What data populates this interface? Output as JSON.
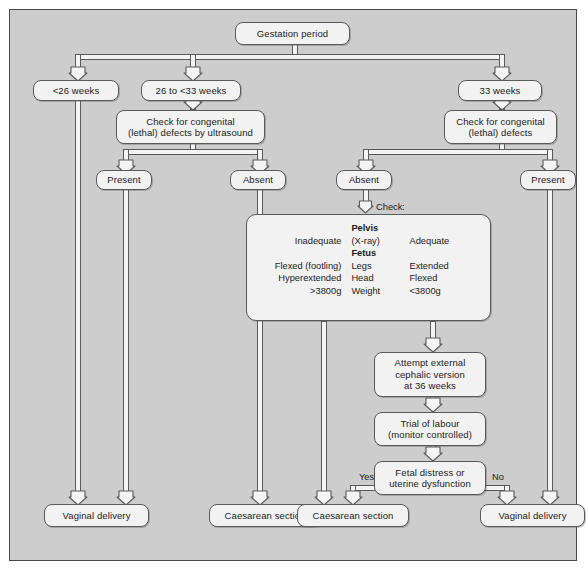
{
  "diagram": {
    "background_color": "#cdcdcd",
    "node_fill": "#f2f2f2",
    "border_color": "#5a5a5a"
  },
  "nodes": {
    "gestation_period": "Gestation period",
    "weeks_lt26": "<26 weeks",
    "weeks_26_to_33": "26 to <33 weeks",
    "weeks_33": "33 weeks",
    "check_ultrasound_l1": "Check for congenital",
    "check_ultrasound_l2": "(lethal) defects by ultrasound",
    "check_defects_l1": "Check for congenital",
    "check_defects_l2": "(lethal) defects",
    "mid_present": "Present",
    "mid_absent": "Absent",
    "right_absent": "Absent",
    "right_present": "Present",
    "ecv_l1": "Attempt external",
    "ecv_l2": "cephalic version",
    "ecv_l3": "at 36 weeks",
    "trial_l1": "Trial of labour",
    "trial_l2": "(monitor controlled)",
    "distress_l1": "Fetal distress or",
    "distress_l2": "uterine dysfunction",
    "outcome_vaginal_left": "Vaginal delivery",
    "outcome_caesarean_left": "Caesarean section",
    "outcome_caesarean_right": "Caesarean section",
    "outcome_vaginal_right": "Vaginal delivery"
  },
  "check_panel": {
    "check_label": "Check:",
    "rows": [
      {
        "left": "",
        "mid": "Pelvis",
        "right": "",
        "bold_mid": true
      },
      {
        "left": "Inadequate",
        "mid": "(X-ray)",
        "right": "Adequate",
        "bold_mid": false
      },
      {
        "left": "",
        "mid": "Fetus",
        "right": "",
        "bold_mid": true
      },
      {
        "left": "Flexed (footling)",
        "mid": "Legs",
        "right": "Extended",
        "bold_mid": false
      },
      {
        "left": "Hyperextended",
        "mid": "Head",
        "right": "Flexed",
        "bold_mid": false
      },
      {
        "left": ">3800g",
        "mid": "Weight",
        "right": "<3800g",
        "bold_mid": false
      }
    ]
  },
  "edge_labels": {
    "yes": "Yes",
    "no": "No"
  }
}
